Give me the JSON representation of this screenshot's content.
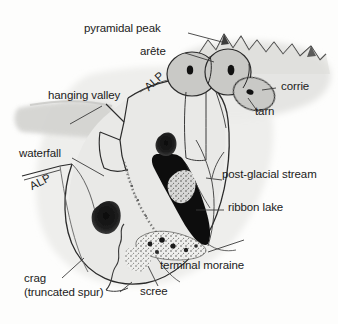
{
  "figure": {
    "style": "hand-drawn line diagram with grey shading and stipple",
    "colors": {
      "background": "#fdfdfc",
      "ink": "#1b1b1b",
      "shade_light": "#e2e2e0",
      "shade_mid": "#cfcfcd",
      "shade_dark": "#b9b9b6",
      "water_black": "#111111",
      "label_text": "#1b1b1b",
      "leader_line": "#3a3a3a"
    }
  },
  "labels": {
    "pyramidal_peak": "pyramidal peak",
    "arete": "arête",
    "corrie": "corrie",
    "tarn": "tarn",
    "hanging_valley": "hanging valley",
    "waterfall": "waterfall",
    "alp_upper": "ALP",
    "alp_lower": "ALP",
    "post_glacial_stream": "post-glacial stream",
    "ribbon_lake": "ribbon lake",
    "terminal_moraine": "terminal moraine",
    "scree": "scree",
    "crag_line1": "crag",
    "crag_line2": "(truncated spur)"
  },
  "features": [
    {
      "name": "pyramidal-peak",
      "kind": "jagged ridge of peaks",
      "position": "top right"
    },
    {
      "name": "arete",
      "kind": "sharp ridge between corries",
      "position": "upper right"
    },
    {
      "name": "corrie",
      "kind": "armchair hollow",
      "count": 3,
      "position": "upper right"
    },
    {
      "name": "tarn",
      "kind": "small dark lake in corrie",
      "count": 3,
      "position": "upper right"
    },
    {
      "name": "hanging-valley",
      "kind": "tributary valley above main valley",
      "position": "left"
    },
    {
      "name": "waterfall",
      "kind": "stream falling from hanging valley",
      "position": "centre left"
    },
    {
      "name": "alp",
      "kind": "flat bench on valley side",
      "count": 2,
      "position": "valley sides"
    },
    {
      "name": "post-glacial-stream",
      "kind": "meltwater stream",
      "position": "centre right"
    },
    {
      "name": "ribbon-lake",
      "kind": "long narrow lake on valley floor",
      "position": "centre"
    },
    {
      "name": "terminal-moraine",
      "kind": "stippled debris ridge",
      "position": "lower centre"
    },
    {
      "name": "scree",
      "kind": "loose rock slope",
      "position": "lower centre"
    },
    {
      "name": "crag",
      "kind": "truncated spur rock face",
      "count": 2,
      "position": "left and centre"
    }
  ]
}
